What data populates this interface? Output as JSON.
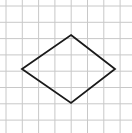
{
  "figure": {
    "canvas": {
      "width": 132,
      "height": 133,
      "background": "#ffffff"
    },
    "grid": {
      "name": "square-grid",
      "origin_x": 6,
      "origin_y": 6,
      "spacing": 16.3,
      "vertical_lines": 8,
      "horizontal_lines": 8,
      "color": "#c8c8c8",
      "stroke_width": 1
    },
    "shape": {
      "name": "rhombus",
      "type": "polygon",
      "fill": "none",
      "stroke": "#1a1a1a",
      "stroke_width": 1.8,
      "points": "71,35 115,69 71,103 22,69",
      "vertices": [
        {
          "label": "top",
          "x": 71,
          "y": 35
        },
        {
          "label": "right",
          "x": 115,
          "y": 69
        },
        {
          "label": "bottom",
          "x": 71,
          "y": 103
        },
        {
          "label": "left",
          "x": 22,
          "y": 69
        }
      ]
    }
  }
}
